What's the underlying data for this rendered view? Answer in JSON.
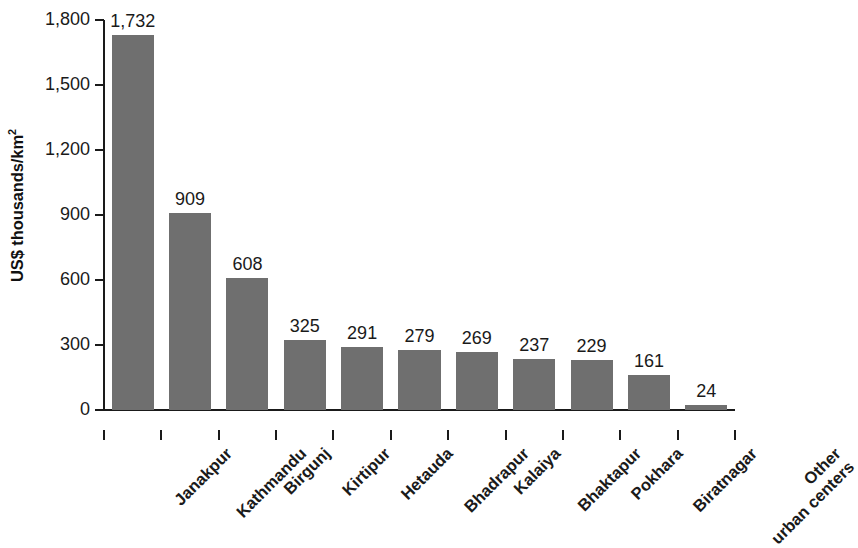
{
  "chart_data": {
    "type": "bar",
    "title": "",
    "subtitle": "",
    "xlabel": "",
    "ylabel": "US$ thousands/km",
    "ylabel_superscript": "2",
    "ylim": [
      0,
      1800
    ],
    "yticks": [
      0,
      300,
      600,
      900,
      1200,
      1500,
      1800
    ],
    "ytick_labels": [
      "0",
      "300",
      "600",
      "900",
      "1,200",
      "1,500",
      "1,800"
    ],
    "grid": false,
    "legend": null,
    "bar_color": "#6f6f6f",
    "categories": [
      "Janakpur",
      "Kathmandu",
      "Birgunj",
      "Kirtipur",
      "Hetauda",
      "Bhadrapur",
      "Kalaiya",
      "Bhaktapur",
      "Pokhara",
      "Biratnagar",
      "Other urban centers"
    ],
    "category_lines": [
      [
        "Janakpur"
      ],
      [
        "Kathmandu"
      ],
      [
        "Birgunj"
      ],
      [
        "Kirtipur"
      ],
      [
        "Hetauda"
      ],
      [
        "Bhadrapur"
      ],
      [
        "Kalaiya"
      ],
      [
        "Bhaktapur"
      ],
      [
        "Pokhara"
      ],
      [
        "Biratnagar"
      ],
      [
        "Other",
        "urban centers"
      ]
    ],
    "values": [
      1732,
      909,
      608,
      325,
      291,
      279,
      269,
      237,
      229,
      161,
      24
    ],
    "value_labels": [
      "1,732",
      "909",
      "608",
      "325",
      "291",
      "279",
      "269",
      "237",
      "229",
      "161",
      "24"
    ]
  }
}
